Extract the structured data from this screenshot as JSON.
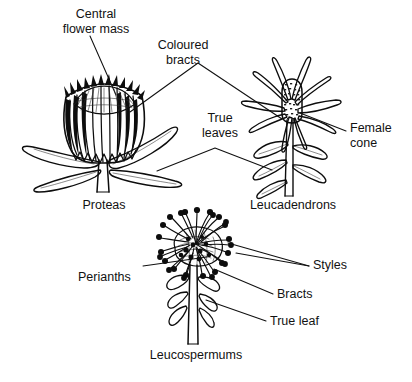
{
  "figure": {
    "background_color": "#ffffff",
    "ink_color": "#0d0d0d",
    "width": 412,
    "height": 382
  },
  "captions": [
    {
      "id": "proteas",
      "text": "Proteas",
      "x": 104,
      "y": 206
    },
    {
      "id": "leucadendrons",
      "text": "Leucadendrons",
      "x": 293,
      "y": 206
    },
    {
      "id": "leucospermums",
      "text": "Leucospermums",
      "x": 196,
      "y": 356
    }
  ],
  "callouts": [
    {
      "id": "central-flower-mass",
      "text_line1": "Central",
      "text_line2": "flower mass",
      "text": "Central flower mass",
      "x": 96,
      "y": 15,
      "anchor": "middle"
    },
    {
      "id": "coloured-bracts",
      "text_line1": "Coloured",
      "text_line2": "bracts",
      "text": "Coloured bracts",
      "x": 183,
      "y": 46,
      "anchor": "middle"
    },
    {
      "id": "true-leaves",
      "text_line1": "True",
      "text_line2": "leaves",
      "text": "True leaves",
      "x": 220,
      "y": 119,
      "anchor": "middle"
    },
    {
      "id": "female-cone",
      "text_line1": "Female",
      "text_line2": "cone",
      "text": "Female cone",
      "x": 350,
      "y": 129,
      "anchor": "start"
    },
    {
      "id": "perianths",
      "text": "Perianths",
      "x": 78,
      "y": 278,
      "anchor": "start"
    },
    {
      "id": "styles",
      "text": "Styles",
      "x": 313,
      "y": 266,
      "anchor": "start"
    },
    {
      "id": "bracts",
      "text": "Bracts",
      "x": 277,
      "y": 295,
      "anchor": "start"
    },
    {
      "id": "true-leaf",
      "text": "True leaf",
      "x": 270,
      "y": 322,
      "anchor": "start"
    }
  ],
  "plants": [
    {
      "id": "protea",
      "common_name": "Proteas",
      "parts": [
        "Central flower mass",
        "Coloured bracts",
        "True leaves"
      ]
    },
    {
      "id": "leucadendron",
      "common_name": "Leucadendrons",
      "parts": [
        "Female cone",
        "Coloured bracts",
        "True leaves"
      ]
    },
    {
      "id": "leucospermum",
      "common_name": "Leucospermums",
      "parts": [
        "Styles",
        "Perianths",
        "Bracts",
        "True leaf"
      ]
    }
  ]
}
